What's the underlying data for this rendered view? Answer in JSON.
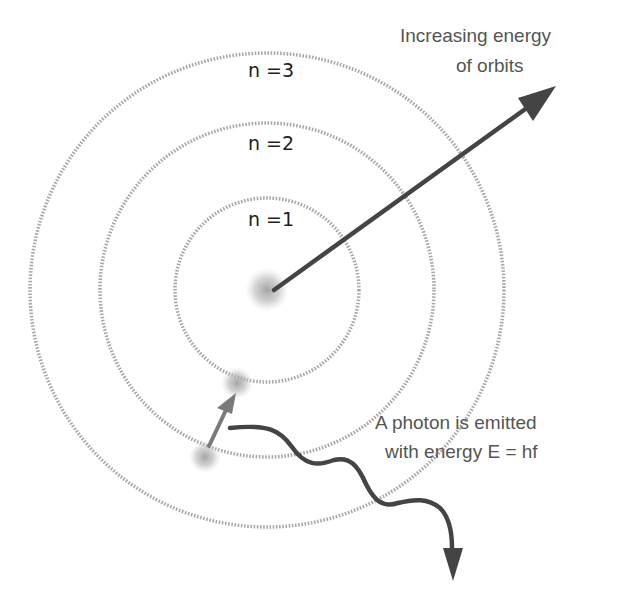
{
  "diagram": {
    "colors": {
      "background": "#ffffff",
      "orbit": "#a8a8a8",
      "arrow": "#444444",
      "jump_arrow": "#7a7a7a",
      "text": "#555555",
      "label": "#1e1e1e"
    },
    "nucleus": {
      "cx": 267,
      "cy": 290
    },
    "orbits": [
      {
        "label": "n =1",
        "radius": 92
      },
      {
        "label": "n =2",
        "radius": 167
      },
      {
        "label": "n =3",
        "radius": 237
      }
    ],
    "energy_caption": {
      "line1": "Increasing energy",
      "line2": "of orbits"
    },
    "photon_caption": {
      "line1": "A photon is emitted",
      "line2": "with energy E = hf"
    },
    "electrons": [
      {
        "name": "electron-initial",
        "cx": 205,
        "cy": 457,
        "orbit": "n =2"
      },
      {
        "name": "electron-final",
        "cx": 237,
        "cy": 383,
        "orbit": "n =1"
      }
    ]
  }
}
